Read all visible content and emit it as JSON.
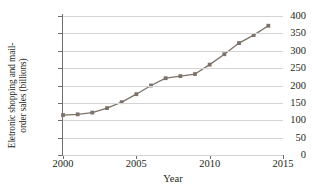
{
  "chart_data": {
    "type": "line",
    "title": "",
    "xlabel": "Year",
    "ylabel": "Eletronic shopping and mail-order sales (billions)",
    "ylabel_lines": [
      "Eletronic shopping and mail-",
      "order sales (billions)"
    ],
    "x": [
      2000,
      2001,
      2002,
      2003,
      2004,
      2005,
      2006,
      2007,
      2008,
      2009,
      2010,
      2011,
      2012,
      2013,
      2014
    ],
    "values": [
      115,
      117,
      122,
      135,
      152,
      175,
      200,
      221,
      227,
      233,
      260,
      290,
      322,
      345,
      372
    ],
    "series": [
      {
        "name": "Eletronic shopping and mail-order sales",
        "values": [
          115,
          117,
          122,
          135,
          152,
          175,
          200,
          221,
          227,
          233,
          260,
          290,
          322,
          345,
          372
        ]
      }
    ],
    "xlim": [
      2000,
      2015
    ],
    "ylim": [
      0,
      400
    ],
    "xticks": [
      2000,
      2005,
      2010,
      2015
    ],
    "xtick_labels": [
      "2000",
      "2005",
      "2010",
      "2015"
    ],
    "yticks": [
      0,
      50,
      100,
      150,
      200,
      250,
      300,
      350,
      400
    ],
    "ytick_labels": [
      "0",
      "50",
      "100",
      "150",
      "200",
      "250",
      "300",
      "350",
      "400"
    ],
    "grid": "horizontal",
    "legend": "none",
    "marker": "square",
    "colors": {
      "line": "#7c7268",
      "marker": "#7c7268",
      "grid": "#d4d4d4",
      "axis": "#6f6f6f",
      "text": "#231f20",
      "background": "#ffffff"
    }
  }
}
